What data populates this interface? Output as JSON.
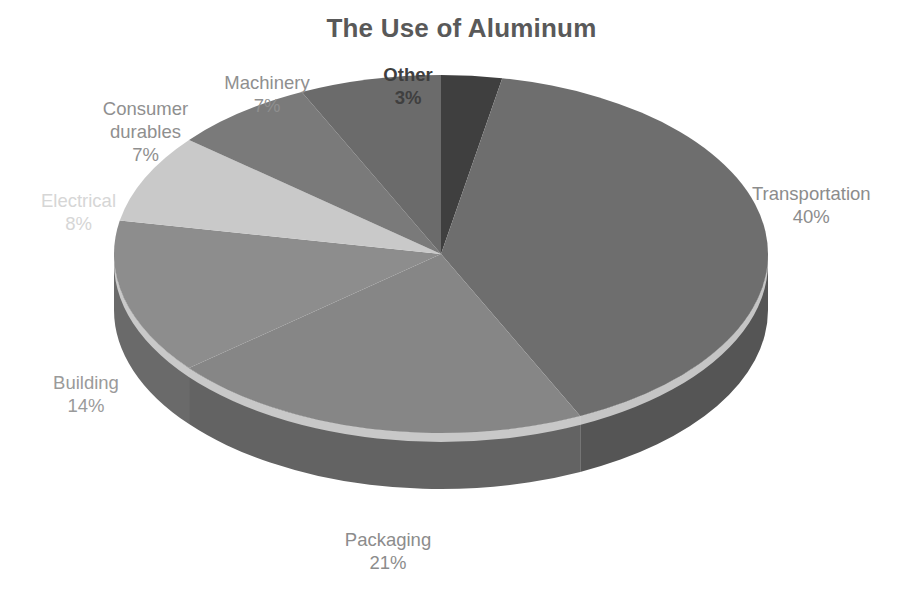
{
  "chart": {
    "title": "The Use of Aluminum"
  },
  "chart_data": {
    "type": "pie",
    "title": "The Use of Aluminum",
    "subtitle": "",
    "xlabel": "",
    "ylabel": "",
    "grid": false,
    "legend_position": "none",
    "style": "3d-exploded-none",
    "units": "percent",
    "total": 100,
    "start_angle_deg": 0,
    "direction": "clockwise",
    "categories": [
      "Other",
      "Transportation",
      "Packaging",
      "Building",
      "Electrical",
      "Consumer durables",
      "Machinery"
    ],
    "values": [
      3,
      40,
      21,
      14,
      8,
      7,
      7
    ],
    "slices": [
      {
        "label": "Other",
        "value": 3,
        "value_text": "3%",
        "color": "#3f3f3f",
        "side_color": "#2e2e2e",
        "label_color": "#3f3f3f",
        "label_bold": true
      },
      {
        "label": "Transportation",
        "value": 40,
        "value_text": "40%",
        "color": "#6e6e6e",
        "side_color": "#555555",
        "label_color": "#8c8c8c",
        "label_bold": false
      },
      {
        "label": "Packaging",
        "value": 21,
        "value_text": "21%",
        "color": "#868686",
        "side_color": "#636363",
        "label_color": "#8c8c8c",
        "label_bold": false
      },
      {
        "label": "Building",
        "value": 14,
        "value_text": "14%",
        "color": "#8d8d8d",
        "side_color": "#6a6a6a",
        "label_color": "#9a9a9a",
        "label_bold": false
      },
      {
        "label": "Electrical",
        "value": 8,
        "value_text": "8%",
        "color": "#c9c9c9",
        "side_color": "#9c9c9c",
        "label_color": "#d6d6d6",
        "label_bold": false
      },
      {
        "label": "Consumer durables",
        "value": 7,
        "value_text": "7%",
        "color": "#7a7a7a",
        "side_color": "#5c5c5c",
        "label_color": "#8f8f8f",
        "label_bold": false
      },
      {
        "label": "Machinery",
        "value": 7,
        "value_text": "7%",
        "color": "#6b6b6b",
        "side_color": "#515151",
        "label_color": "#8f8f8f",
        "label_bold": false
      }
    ]
  },
  "labels": {
    "transportation": {
      "name": "Transportation",
      "pct": "40%"
    },
    "packaging": {
      "name": "Packaging",
      "pct": "21%"
    },
    "building": {
      "name": "Building",
      "pct": "14%"
    },
    "electrical": {
      "name": "Electrical",
      "pct": "8%"
    },
    "consumer": {
      "name1": "Consumer",
      "name2": "durables",
      "pct": "7%"
    },
    "machinery": {
      "name": "Machinery",
      "pct": "7%"
    },
    "other": {
      "name": "Other",
      "pct": "3%"
    }
  },
  "colors": {
    "title": "#595959",
    "background": "#ffffff",
    "rim_highlight": "#d9d9d9"
  }
}
